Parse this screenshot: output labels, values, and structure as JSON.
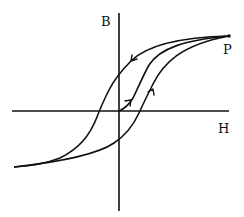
{
  "diagram": {
    "axes": {
      "vertical_label": "B",
      "horizontal_label": "H"
    },
    "points": {
      "saturation_label": "P"
    },
    "curves": [
      {
        "name": "initial-magnetization-curve",
        "from": "origin",
        "to": "P",
        "arrow": "up-right"
      },
      {
        "name": "upper-descending-branch",
        "from": "P",
        "to": "negative-saturation",
        "arrow": "down-left"
      },
      {
        "name": "lower-ascending-branch",
        "from": "negative-saturation",
        "to": "P",
        "arrow": "up-right"
      }
    ],
    "colors": {
      "line": "#111111",
      "background": "#ffffff"
    }
  }
}
